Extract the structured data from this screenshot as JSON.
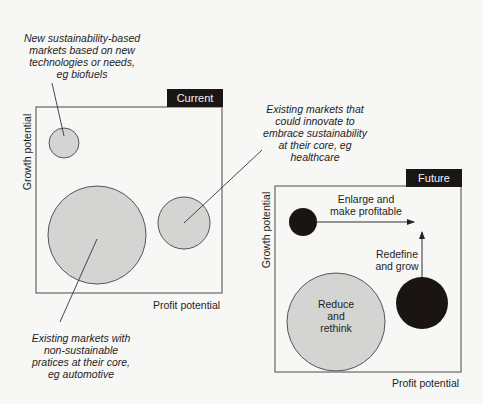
{
  "current_panel": {
    "tag": "Current",
    "y_axis": "Growth potential",
    "x_axis": "Profit potential",
    "annotations": {
      "small_circle": [
        "New sustainability-based",
        "markets based on new",
        "technologies or needs,",
        "eg biofuels"
      ],
      "right_circle": [
        "Existing markets that",
        "could innovate to",
        "embrace sustainability",
        "at their core, eg",
        "healthcare"
      ],
      "large_circle": [
        "Existing markets with",
        "non-sustainable",
        "pratices at their core,",
        "eg automotive"
      ]
    }
  },
  "future_panel": {
    "tag": "Future",
    "y_axis": "Growth potential",
    "x_axis": "Profit potential",
    "labels": {
      "enlarge": [
        "Enlarge and",
        "make profitable"
      ],
      "redefine": [
        "Redefine",
        "and grow"
      ],
      "reduce": [
        "Reduce",
        "and",
        "rethink"
      ]
    }
  },
  "colors": {
    "grey_fill": "#d4d4d2",
    "black_fill": "#1a1414",
    "stroke": "#555555"
  }
}
